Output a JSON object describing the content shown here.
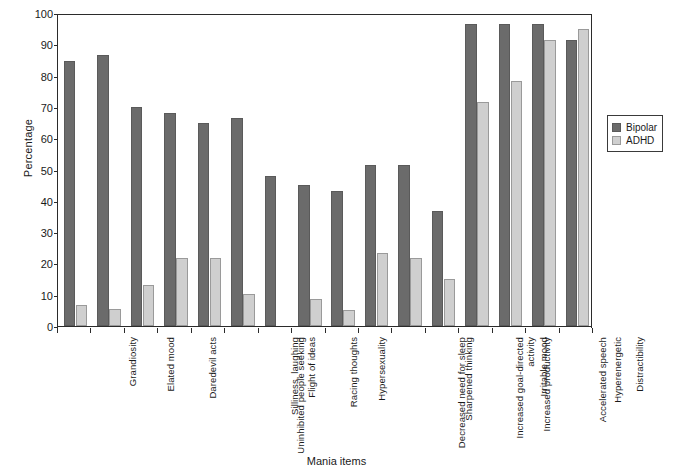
{
  "chart_data": {
    "type": "bar",
    "title": "",
    "xlabel": "Mania items",
    "ylabel": "Percentage",
    "ylim": [
      0,
      100
    ],
    "ytick_labels": [
      "0",
      "10",
      "20",
      "30",
      "40",
      "50",
      "60",
      "70",
      "80",
      "90",
      "100"
    ],
    "ytick_values": [
      0,
      10,
      20,
      30,
      40,
      50,
      60,
      70,
      80,
      90,
      100
    ],
    "grid": false,
    "legend_position": "right",
    "categories": [
      "Grandiosity",
      "Elated mood",
      "Daredevil acts",
      "Uninhibited people seeking",
      "Silliness, laughing",
      "Flight of ideas",
      "Racing thoughts",
      "Hypersexuality",
      "Decreased need for sleep",
      "Sharpened thinking",
      "Increased goal-directed\nactivity",
      "Increased productivity",
      "Irritable mood",
      "Accelerated speech",
      "Hyperenergetic",
      "Distractibility"
    ],
    "series": [
      {
        "name": "Bipolar",
        "color": "#6b6b6b",
        "values": [
          84.7,
          86.5,
          70.0,
          68.2,
          64.8,
          66.6,
          48.0,
          45.0,
          43.2,
          51.5,
          51.5,
          36.6,
          96.4,
          96.4,
          96.4,
          91.3
        ]
      },
      {
        "name": "ADHD",
        "color": "#cfcfcf",
        "values": [
          6.8,
          5.5,
          13.2,
          21.8,
          21.8,
          10.2,
          0,
          8.5,
          5.1,
          23.4,
          21.8,
          15.0,
          71.5,
          78.3,
          91.3,
          94.8
        ]
      }
    ]
  },
  "legend": {
    "items": [
      {
        "label": "Bipolar",
        "swatch": "bipolar"
      },
      {
        "label": "ADHD",
        "swatch": "adhd"
      }
    ]
  }
}
